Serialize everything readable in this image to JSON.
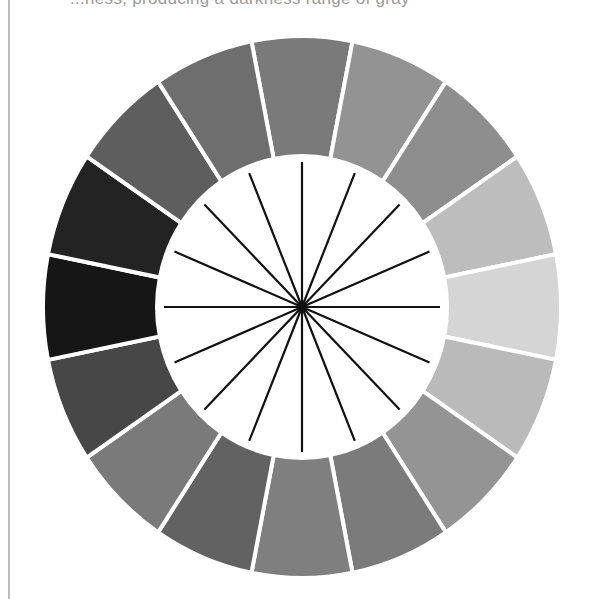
{
  "caption_fragment": "...ness, producing a darkness range of gray",
  "chart_data": {
    "type": "diagram",
    "center": [
      302,
      307
    ],
    "outer_radius": [
      259,
      271
    ],
    "inner_radius": [
      145,
      151
    ],
    "spoke_radius": [
      138,
      145
    ],
    "segment_count": 16,
    "spoke_count": 16,
    "gap_color": "#ffffff",
    "spoke_color": "#111111",
    "segments": [
      {
        "angle_deg": 90,
        "color": "#7a7a7a"
      },
      {
        "angle_deg": 67.5,
        "color": "#939393"
      },
      {
        "angle_deg": 45,
        "color": "#8e8e8e"
      },
      {
        "angle_deg": 22.5,
        "color": "#bdbdbd"
      },
      {
        "angle_deg": 0,
        "color": "#d5d5d5"
      },
      {
        "angle_deg": -22.5,
        "color": "#bababa"
      },
      {
        "angle_deg": -45,
        "color": "#949494"
      },
      {
        "angle_deg": -67.5,
        "color": "#7b7b7b"
      },
      {
        "angle_deg": -90,
        "color": "#7f7f7f"
      },
      {
        "angle_deg": -112.5,
        "color": "#626262"
      },
      {
        "angle_deg": -135,
        "color": "#7a7a7a"
      },
      {
        "angle_deg": -157.5,
        "color": "#474747"
      },
      {
        "angle_deg": 180,
        "color": "#161616"
      },
      {
        "angle_deg": 157.5,
        "color": "#232323"
      },
      {
        "angle_deg": 135,
        "color": "#5e5e5e"
      },
      {
        "angle_deg": 112.5,
        "color": "#6e6e6e"
      }
    ]
  }
}
